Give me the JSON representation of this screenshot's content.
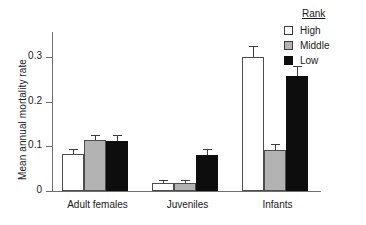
{
  "chart_data": {
    "type": "bar",
    "title": "",
    "xlabel": "",
    "ylabel": "Mean annual mortality rate",
    "categories": [
      "Adult females",
      "Juveniles",
      "Infants"
    ],
    "ylim": [
      0,
      0.345
    ],
    "yticks": [
      0,
      0.1,
      0.2,
      0.3
    ],
    "ytick_labels": [
      "0",
      "0.1",
      "0.2",
      "0.3"
    ],
    "grid": false,
    "legend": {
      "title": "Rank",
      "position": "top-right",
      "entries": [
        {
          "name": "High",
          "color": "#ffffff"
        },
        {
          "name": "Middle",
          "color": "#b3b3b3"
        },
        {
          "name": "Low",
          "color": "#0d0d0d"
        }
      ]
    },
    "series": [
      {
        "name": "High",
        "color": "#ffffff",
        "values": [
          0.08,
          0.018,
          0.29
        ],
        "errors": [
          0.009,
          0.004,
          0.022
        ]
      },
      {
        "name": "Middle",
        "color": "#b3b3b3",
        "values": [
          0.11,
          0.018,
          0.089
        ],
        "errors": [
          0.009,
          0.004,
          0.01
        ]
      },
      {
        "name": "Low",
        "color": "#0d0d0d",
        "values": [
          0.109,
          0.078,
          0.249
        ],
        "errors": [
          0.011,
          0.01,
          0.02
        ]
      }
    ],
    "error_bar_type": "standard-error"
  },
  "axis": {
    "y_title": "Mean annual mortality rate",
    "tick_0": "0",
    "tick_1": "0.1",
    "tick_2": "0.2",
    "tick_3": "0.3"
  },
  "legend": {
    "title": "Rank",
    "high": "High",
    "middle": "Middle",
    "low": "Low"
  },
  "categories": {
    "c0": "Adult females",
    "c1": "Juveniles",
    "c2": "Infants"
  }
}
